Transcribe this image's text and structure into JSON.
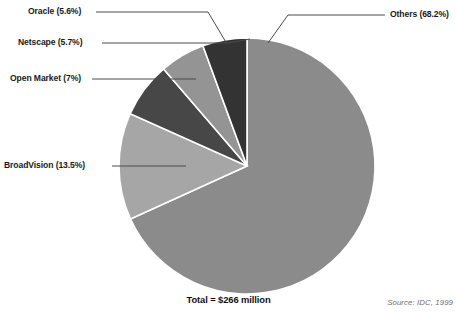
{
  "chart_data": {
    "type": "pie",
    "title": "Total = $266 million",
    "source": "Source: IDC, 1999",
    "categories": [
      "Others",
      "BroadVision",
      "Open Market",
      "Netscape",
      "Oracle"
    ],
    "values": [
      68.2,
      13.5,
      7,
      5.7,
      5.6
    ],
    "unit": "percent",
    "total_value": 266,
    "total_unit": "$ million",
    "start_angle_deg": 0,
    "direction": "clockwise",
    "legend": "callout-labels",
    "grid": false,
    "slices": [
      {
        "name": "Others",
        "percent": 68.2,
        "label": "Others (68.2%)",
        "color": "#8b8b8b",
        "start_deg": 0,
        "end_deg": 245.52
      },
      {
        "name": "BroadVision",
        "percent": 13.5,
        "label": "BroadVision (13.5%)",
        "color": "#a6a6a6",
        "start_deg": 245.52,
        "end_deg": 294.12
      },
      {
        "name": "Open Market",
        "percent": 7.0,
        "label": "Open Market (7%)",
        "color": "#474747",
        "start_deg": 294.12,
        "end_deg": 319.32
      },
      {
        "name": "Netscape",
        "percent": 5.7,
        "label": "Netscape (5.7%)",
        "color": "#949494",
        "start_deg": 319.32,
        "end_deg": 339.84
      },
      {
        "name": "Oracle",
        "percent": 5.6,
        "label": "Oracle (5.6%)",
        "color": "#333333",
        "start_deg": 339.84,
        "end_deg": 360
      }
    ],
    "geometry": {
      "cx": 247,
      "cy": 166,
      "r": 128
    },
    "colors": {
      "others": "#8b8b8b",
      "broadvision": "#a6a6a6",
      "open_market": "#474747",
      "netscape": "#949494",
      "oracle": "#333333",
      "slice_border": "#ffffff",
      "leader_line": "#4a4a4a",
      "text": "#1a1a1a",
      "source_text": "#6f6f6f"
    }
  }
}
